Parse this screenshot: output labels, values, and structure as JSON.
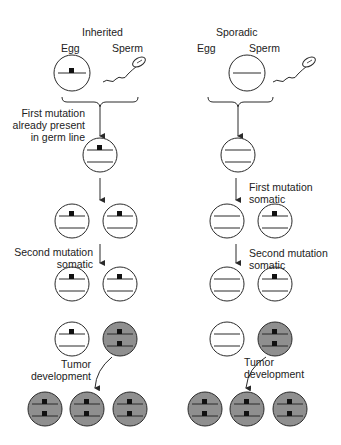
{
  "colors": {
    "line": "#2a2a2a",
    "tumor_fill": "#8f8f8f",
    "mutation": "#111111",
    "background": "#ffffff"
  },
  "inherited": {
    "title": "Inherited",
    "egg_label": "Egg",
    "sperm_label": "Sperm",
    "step1": [
      "First mutation",
      "already present",
      "in germ line"
    ],
    "step2": [
      "Second mutation",
      "somatic"
    ],
    "step3": [
      "Tumor",
      "development"
    ]
  },
  "sporadic": {
    "title": "Sporadic",
    "egg_label": "Egg",
    "sperm_label": "Sperm",
    "step1": [
      "First mutation",
      "somatic"
    ],
    "step2": [
      "Second mutation",
      "somatic"
    ],
    "step3": [
      "Tumor",
      "development"
    ]
  }
}
